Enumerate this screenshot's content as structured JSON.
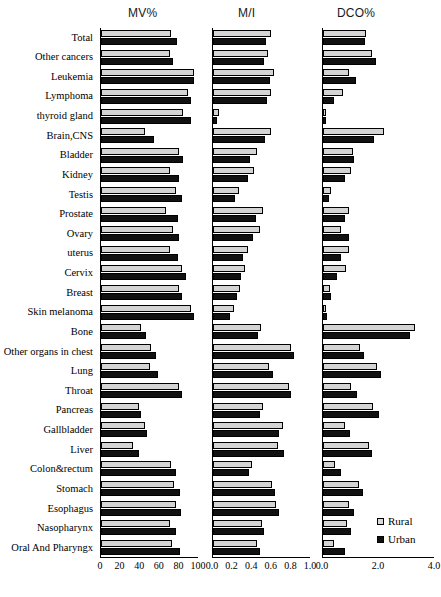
{
  "chart_data": {
    "type": "bar",
    "title": "",
    "orientation": "horizontal",
    "grid": false,
    "legend": {
      "position": "bottom-right",
      "entries": [
        {
          "name": "Rural",
          "color": "#d9d9d9"
        },
        {
          "name": "Urban",
          "color": "#111111"
        }
      ]
    },
    "categories": [
      "Total",
      "Other cancers",
      "Leukemia",
      "Lymphoma",
      "thyroid gland",
      "Brain,CNS",
      "Bladder",
      "Kidney",
      "Testis",
      "Prostate",
      "Ovary",
      "uterus",
      "Cervix",
      "Breast",
      "Skin melanoma",
      "Bone",
      "Other organs in chest",
      "Lung",
      "Throat",
      "Pancreas",
      "Gallbladder",
      "Liver",
      "Colon&rectum",
      "Stomach",
      "Esophagus",
      "Nasopharynx",
      "Oral And Pharyngx"
    ],
    "panels": [
      {
        "key": "mv",
        "title": "MV%",
        "xlabel": "",
        "xlim": [
          0,
          100
        ],
        "ticks": [
          0,
          20,
          40,
          60,
          80,
          100
        ],
        "tick_labels": [
          "0",
          "20",
          "40",
          "60",
          "80",
          "100"
        ],
        "series": [
          {
            "name": "Rural",
            "values": [
              72,
              71,
              96,
              90,
              85,
              45,
              80,
              71,
              77,
              67,
              74,
              71,
              83,
              80,
              93,
              41,
              52,
              51,
              80,
              39,
              45,
              33,
              72,
              75,
              77,
              71,
              73
            ]
          },
          {
            "name": "Urban",
            "values": [
              78,
              74,
              96,
              93,
              93,
              55,
              85,
              80,
              83,
              79,
              80,
              79,
              88,
              84,
              96,
              46,
              57,
              59,
              84,
              41,
              47,
              39,
              77,
              81,
              82,
              77,
              81
            ]
          }
        ]
      },
      {
        "key": "mi",
        "title": "M/I",
        "xlabel": "",
        "xlim": [
          0.0,
          1.0
        ],
        "ticks": [
          0.0,
          0.2,
          0.4,
          0.6,
          0.8,
          1.0
        ],
        "tick_labels": [
          "0.0",
          "0.2",
          "0.4",
          "0.6",
          "0.8",
          "1.0"
        ],
        "series": [
          {
            "name": "Rural",
            "values": [
              0.6,
              0.57,
              0.63,
              0.6,
              0.06,
              0.6,
              0.45,
              0.42,
              0.27,
              0.52,
              0.48,
              0.36,
              0.33,
              0.28,
              0.22,
              0.49,
              0.8,
              0.58,
              0.78,
              0.52,
              0.72,
              0.67,
              0.4,
              0.61,
              0.65,
              0.5,
              0.45
            ]
          },
          {
            "name": "Urban",
            "values": [
              0.55,
              0.53,
              0.59,
              0.56,
              0.04,
              0.54,
              0.38,
              0.36,
              0.23,
              0.44,
              0.41,
              0.31,
              0.29,
              0.25,
              0.18,
              0.46,
              0.84,
              0.62,
              0.8,
              0.48,
              0.68,
              0.73,
              0.37,
              0.64,
              0.68,
              0.53,
              0.48
            ]
          }
        ]
      },
      {
        "key": "dco",
        "title": "DCO%",
        "xlabel": "",
        "xlim": [
          0.0,
          4.0
        ],
        "ticks": [
          0.0,
          2.0,
          4.0
        ],
        "tick_labels": [
          "0.0",
          "2.0",
          "4.0"
        ],
        "series": [
          {
            "name": "Rural",
            "values": [
              1.55,
              1.75,
              0.95,
              0.72,
              0.12,
              2.2,
              1.08,
              1.0,
              0.3,
              0.92,
              0.66,
              0.93,
              0.83,
              0.26,
              0.1,
              3.3,
              1.35,
              1.95,
              1.0,
              1.8,
              0.8,
              1.65,
              0.45,
              1.28,
              0.95,
              0.85,
              0.4
            ]
          },
          {
            "name": "Urban",
            "values": [
              1.52,
              1.9,
              1.18,
              0.4,
              0.12,
              1.82,
              1.1,
              0.78,
              0.22,
              0.78,
              0.95,
              0.65,
              0.52,
              0.3,
              0.14,
              3.15,
              1.48,
              2.1,
              1.22,
              2.0,
              0.98,
              1.78,
              0.65,
              1.45,
              1.1,
              1.0,
              0.8
            ]
          }
        ]
      }
    ]
  }
}
